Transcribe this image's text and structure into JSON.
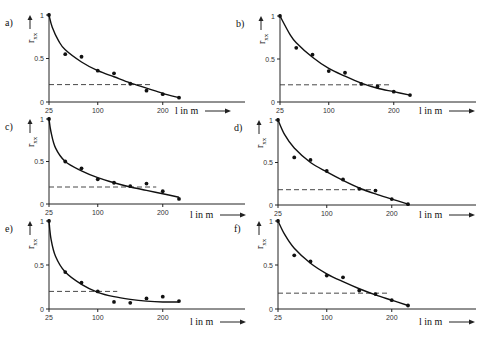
{
  "chart_data": [
    {
      "panel": "a)",
      "type": "scatter",
      "xlabel": "l in m",
      "ylabel": "r_xx",
      "x_ticks": [
        "25",
        "100",
        "200"
      ],
      "y_ticks": [
        "0",
        "0.5",
        "1"
      ],
      "ylim": [
        0,
        1
      ],
      "points": [
        [
          25,
          1.0
        ],
        [
          50,
          0.55
        ],
        [
          75,
          0.52
        ],
        [
          100,
          0.36
        ],
        [
          125,
          0.33
        ],
        [
          150,
          0.21
        ],
        [
          175,
          0.13
        ],
        [
          200,
          0.09
        ],
        [
          225,
          0.05
        ]
      ],
      "fit_curve": [
        [
          25,
          1.0
        ],
        [
          30,
          0.86
        ],
        [
          40,
          0.7
        ],
        [
          50,
          0.6
        ],
        [
          75,
          0.46
        ],
        [
          100,
          0.36
        ],
        [
          125,
          0.29
        ],
        [
          150,
          0.22
        ],
        [
          175,
          0.16
        ],
        [
          200,
          0.1
        ],
        [
          225,
          0.05
        ]
      ],
      "threshold": {
        "y": 0.2,
        "x_range": [
          25,
          185
        ]
      }
    },
    {
      "panel": "b)",
      "type": "scatter",
      "xlabel": "l in m",
      "ylabel": "r_xx",
      "x_ticks": [
        "25",
        "100",
        "200"
      ],
      "y_ticks": [
        "0",
        "0.5",
        "1"
      ],
      "ylim": [
        0,
        1
      ],
      "points": [
        [
          25,
          1.0
        ],
        [
          50,
          0.63
        ],
        [
          75,
          0.55
        ],
        [
          100,
          0.36
        ],
        [
          125,
          0.34
        ],
        [
          150,
          0.21
        ],
        [
          175,
          0.18
        ],
        [
          200,
          0.12
        ],
        [
          225,
          0.08
        ]
      ],
      "fit_curve": [
        [
          25,
          1.0
        ],
        [
          40,
          0.79
        ],
        [
          50,
          0.69
        ],
        [
          75,
          0.52
        ],
        [
          100,
          0.39
        ],
        [
          125,
          0.3
        ],
        [
          150,
          0.22
        ],
        [
          175,
          0.16
        ],
        [
          200,
          0.12
        ],
        [
          225,
          0.08
        ]
      ],
      "threshold": {
        "y": 0.2,
        "x_range": [
          25,
          195
        ]
      }
    },
    {
      "panel": "c)",
      "type": "scatter",
      "xlabel": "l in m",
      "ylabel": "r_xx",
      "x_ticks": [
        "25",
        "100",
        "200"
      ],
      "y_ticks": [
        "0",
        "0.5",
        "1"
      ],
      "ylim": [
        0,
        1
      ],
      "points": [
        [
          25,
          1.0
        ],
        [
          50,
          0.5
        ],
        [
          75,
          0.42
        ],
        [
          100,
          0.29
        ],
        [
          125,
          0.25
        ],
        [
          150,
          0.21
        ],
        [
          175,
          0.24
        ],
        [
          200,
          0.15
        ],
        [
          225,
          0.06
        ]
      ],
      "fit_curve": [
        [
          25,
          1.0
        ],
        [
          28,
          0.85
        ],
        [
          35,
          0.66
        ],
        [
          50,
          0.5
        ],
        [
          75,
          0.39
        ],
        [
          100,
          0.31
        ],
        [
          125,
          0.25
        ],
        [
          150,
          0.2
        ],
        [
          175,
          0.16
        ],
        [
          200,
          0.12
        ],
        [
          225,
          0.08
        ]
      ],
      "threshold": {
        "y": 0.2,
        "x_range": [
          25,
          190
        ]
      }
    },
    {
      "panel": "d)",
      "type": "scatter",
      "xlabel": "l in m",
      "ylabel": "r_xx",
      "x_ticks": [
        "25",
        "100",
        "200"
      ],
      "y_ticks": [
        "0",
        "0.5",
        "1"
      ],
      "ylim": [
        0,
        1
      ],
      "points": [
        [
          25,
          1.0
        ],
        [
          50,
          0.56
        ],
        [
          75,
          0.53
        ],
        [
          100,
          0.4
        ],
        [
          125,
          0.3
        ],
        [
          150,
          0.19
        ],
        [
          175,
          0.17
        ],
        [
          200,
          0.07
        ],
        [
          225,
          0.01
        ]
      ],
      "fit_curve": [
        [
          25,
          1.0
        ],
        [
          35,
          0.83
        ],
        [
          50,
          0.67
        ],
        [
          75,
          0.5
        ],
        [
          100,
          0.39
        ],
        [
          125,
          0.29
        ],
        [
          150,
          0.2
        ],
        [
          175,
          0.13
        ],
        [
          200,
          0.07
        ],
        [
          225,
          0.01
        ]
      ],
      "threshold": {
        "y": 0.18,
        "x_range": [
          25,
          175
        ]
      }
    },
    {
      "panel": "e)",
      "type": "scatter",
      "xlabel": "l in m",
      "ylabel": "r_xx",
      "x_ticks": [
        "25",
        "100",
        "200"
      ],
      "y_ticks": [
        "0",
        "0.5",
        "1"
      ],
      "ylim": [
        0,
        1
      ],
      "points": [
        [
          25,
          1.0
        ],
        [
          50,
          0.42
        ],
        [
          75,
          0.3
        ],
        [
          100,
          0.2
        ],
        [
          125,
          0.08
        ],
        [
          150,
          0.07
        ],
        [
          175,
          0.12
        ],
        [
          200,
          0.14
        ],
        [
          225,
          0.09
        ]
      ],
      "fit_curve": [
        [
          25,
          1.0
        ],
        [
          28,
          0.8
        ],
        [
          35,
          0.6
        ],
        [
          50,
          0.42
        ],
        [
          75,
          0.28
        ],
        [
          100,
          0.19
        ],
        [
          125,
          0.14
        ],
        [
          150,
          0.11
        ],
        [
          175,
          0.09
        ],
        [
          200,
          0.08
        ],
        [
          225,
          0.08
        ]
      ],
      "threshold": {
        "y": 0.2,
        "x_range": [
          25,
          130
        ]
      }
    },
    {
      "panel": "f)",
      "type": "scatter",
      "xlabel": "l in m",
      "ylabel": "r_xx",
      "x_ticks": [
        "25",
        "100",
        "200"
      ],
      "y_ticks": [
        "0",
        "0.5",
        "1"
      ],
      "ylim": [
        0,
        1
      ],
      "points": [
        [
          25,
          1.0
        ],
        [
          50,
          0.61
        ],
        [
          75,
          0.54
        ],
        [
          100,
          0.38
        ],
        [
          125,
          0.36
        ],
        [
          150,
          0.21
        ],
        [
          175,
          0.17
        ],
        [
          200,
          0.1
        ],
        [
          225,
          0.04
        ]
      ],
      "fit_curve": [
        [
          25,
          1.0
        ],
        [
          35,
          0.85
        ],
        [
          50,
          0.69
        ],
        [
          75,
          0.52
        ],
        [
          100,
          0.4
        ],
        [
          125,
          0.31
        ],
        [
          150,
          0.23
        ],
        [
          175,
          0.16
        ],
        [
          200,
          0.1
        ],
        [
          225,
          0.04
        ]
      ],
      "threshold": {
        "y": 0.18,
        "x_range": [
          25,
          195
        ]
      }
    }
  ],
  "layout": {
    "panels": [
      {
        "ox": 49,
        "y0": 102,
        "y1": 15,
        "xend": 245,
        "xlabel_x": 175,
        "xlabel_y": 114
      },
      {
        "ox": 280,
        "y0": 102,
        "y1": 16,
        "xend": 476,
        "xlabel_x": 419,
        "xlabel_y": 114
      },
      {
        "ox": 49,
        "y0": 204,
        "y1": 119,
        "xend": 245,
        "xlabel_x": 190,
        "xlabel_y": 218
      },
      {
        "ox": 278,
        "y0": 205,
        "y1": 120,
        "xend": 476,
        "xlabel_x": 419,
        "xlabel_y": 218
      },
      {
        "ox": 49,
        "y0": 309,
        "y1": 221,
        "xend": 245,
        "xlabel_x": 190,
        "xlabel_y": 325
      },
      {
        "ox": 278,
        "y0": 309,
        "y1": 221,
        "xend": 476,
        "xlabel_x": 419,
        "xlabel_y": 325
      }
    ],
    "px_per_m": 0.65
  }
}
